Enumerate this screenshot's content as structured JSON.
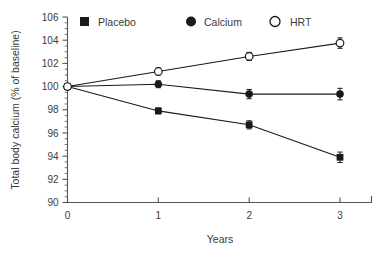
{
  "chart_data": {
    "type": "line",
    "title": "",
    "xlabel": "Years",
    "ylabel": "Total body calcium (% of baseline)",
    "x": [
      0,
      1,
      2,
      3
    ],
    "xtick_labels": [
      "0",
      "1",
      "2",
      "3"
    ],
    "ytick_labels": [
      "90",
      "92",
      "94",
      "96",
      "98",
      "100",
      "102",
      "104",
      "106"
    ],
    "yticks": [
      90,
      92,
      94,
      96,
      98,
      100,
      102,
      104,
      106
    ],
    "xlim": [
      0,
      3
    ],
    "ylim": [
      90,
      106
    ],
    "grid": false,
    "legend_position": "top",
    "series": [
      {
        "name": "Placebo",
        "marker": "filled-square",
        "color": "#1a1a1a",
        "values": [
          100.0,
          97.9,
          96.7,
          93.9
        ],
        "errors": [
          0.0,
          0.25,
          0.35,
          0.45
        ]
      },
      {
        "name": "Calcium",
        "marker": "filled-circle",
        "color": "#1a1a1a",
        "values": [
          100.0,
          100.2,
          99.35,
          99.35
        ],
        "errors": [
          0.0,
          0.3,
          0.4,
          0.5
        ]
      },
      {
        "name": "HRT",
        "marker": "open-circle",
        "color": "#1a1a1a",
        "values": [
          100.0,
          101.3,
          102.6,
          103.75
        ],
        "errors": [
          0.0,
          0.3,
          0.35,
          0.45
        ]
      }
    ]
  },
  "legend": {
    "items": [
      {
        "label": "Placebo",
        "marker": "filled-square"
      },
      {
        "label": "Calcium",
        "marker": "filled-circle"
      },
      {
        "label": "HRT",
        "marker": "open-circle"
      }
    ]
  },
  "axes": {
    "x_title": "Years",
    "y_title": "Total body calcium (% of baseline)"
  },
  "colors": {
    "ink": "#1a1a1a",
    "text": "#3a3a3a",
    "axis": "#555555",
    "background": "#ffffff"
  }
}
